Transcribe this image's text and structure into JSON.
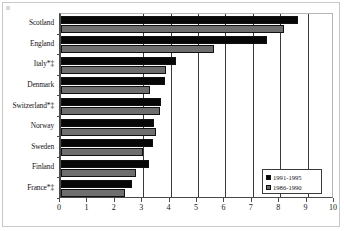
{
  "chart_data": {
    "type": "bar",
    "orientation": "horizontal",
    "title": "",
    "subtitle": "",
    "xlabel": "",
    "ylabel": "",
    "xlim": [
      0,
      10
    ],
    "xticks": [
      0,
      1,
      2,
      3,
      4,
      5,
      6,
      7,
      8,
      9,
      10
    ],
    "xtick_labels": [
      "0",
      "1",
      "2",
      "3",
      "4",
      "5",
      "6",
      "7",
      "8",
      "9",
      "10"
    ],
    "grid": "vertical-major",
    "gridline_values": [
      3,
      4,
      5,
      6,
      7,
      8,
      9
    ],
    "categories": [
      "Scotland",
      "England",
      "Italy*‡",
      "Denmark",
      "Switzerland*‡",
      "Norway",
      "Sweden",
      "Finland",
      "France*‡"
    ],
    "series": [
      {
        "name": "1991-1995",
        "color": "#070707",
        "values": [
          8.65,
          7.5,
          4.2,
          3.8,
          3.65,
          3.4,
          3.35,
          3.2,
          2.6
        ]
      },
      {
        "name": "1986-1990",
        "color": "#6e6e6e",
        "values": [
          8.15,
          5.6,
          3.85,
          3.25,
          3.6,
          3.45,
          3.0,
          2.75,
          2.35
        ]
      }
    ],
    "legend": {
      "position": "bottom-right",
      "entries": [
        {
          "label": "1991-1995",
          "color": "#070707"
        },
        {
          "label": "1986-1990",
          "color": "#6e6e6e"
        }
      ]
    },
    "annotations": []
  }
}
